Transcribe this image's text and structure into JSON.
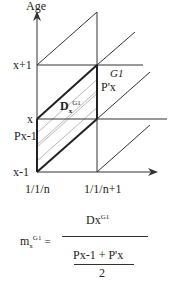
{
  "axes": {
    "y_label": "Age",
    "y_ticks": [
      "x+1",
      "x",
      "x-1"
    ],
    "x_ticks": [
      "1/1/n",
      "1/1/n+1"
    ]
  },
  "annotations": {
    "population_start": "Px-1",
    "population_end": "P'x",
    "generation": "G1",
    "deaths_main": "D",
    "deaths_sub": "x",
    "deaths_sup": "G1"
  },
  "formula": {
    "lhs_main": "m",
    "lhs_sub": "x",
    "lhs_sup": "G1",
    "equals": "=",
    "numerator_main": "Dx",
    "numerator_sup": "G1",
    "denominator_expr": "Px-1 + P'x",
    "denominator_div": "2"
  },
  "colors": {
    "line": "#333333",
    "hatch": "#888888",
    "background": "#ffffff"
  }
}
